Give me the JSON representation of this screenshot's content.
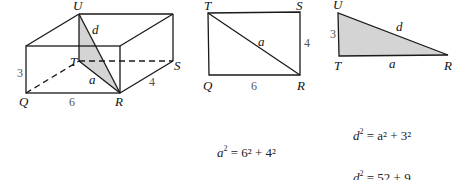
{
  "box": {
    "vertices": {
      "U": "U",
      "T": "T",
      "S": "S",
      "Q": "Q",
      "R": "R"
    },
    "edge_labels": {
      "height": "3",
      "length": "6",
      "width": "4",
      "diagonal_base": "a",
      "diagonal_space": "d"
    }
  },
  "rectangle": {
    "vertices": {
      "T": "T",
      "S": "S",
      "Q": "Q",
      "R": "R"
    },
    "edge_labels": {
      "right": "4",
      "bottom": "6",
      "diagonal": "a"
    }
  },
  "triangle": {
    "vertices": {
      "U": "U",
      "T": "T",
      "R": "R"
    },
    "edge_labels": {
      "vertical": "3",
      "base": "a",
      "hypotenuse": "d"
    }
  },
  "equations_a": [
    {
      "lhs": "a",
      "exp": "2",
      "rhs": "= 6² + 4²"
    },
    {
      "lhs": "a",
      "exp": "2",
      "rhs": "= 36 + 16"
    },
    {
      "lhs": "a",
      "exp": "2",
      "rhs": "= 52"
    }
  ],
  "equations_d": [
    {
      "lhs": "d",
      "exp": "2",
      "rhs": "= a² + 3²"
    },
    {
      "lhs": "d",
      "exp": "2",
      "rhs": "= 52 + 9"
    },
    {
      "lhs": "d",
      "exp": "2",
      "rhs": "= 61"
    },
    {
      "lhs": "d",
      "exp": "",
      "rhs": "= √61"
    }
  ],
  "colors": {
    "shade": "#d4d4d4",
    "line": "#1a1a1a"
  }
}
